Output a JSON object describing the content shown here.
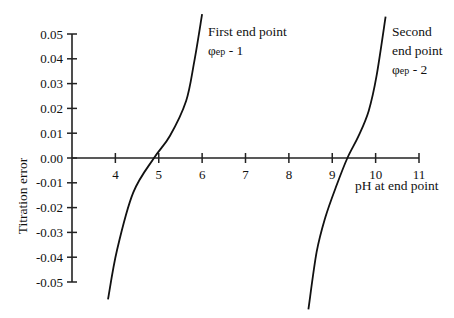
{
  "chart_data": {
    "type": "line",
    "title": "",
    "xlabel": "pH at end point",
    "ylabel": "Titration error",
    "xlim": [
      3,
      11
    ],
    "ylim": [
      -0.05,
      0.05
    ],
    "x_ticks": [
      4,
      5,
      6,
      7,
      8,
      9,
      10,
      11
    ],
    "x_tick_labels": [
      "4",
      "5",
      "6",
      "7",
      "8",
      "9",
      "10",
      "11"
    ],
    "y_ticks": [
      0.05,
      0.04,
      0.03,
      0.02,
      0.01,
      0.0,
      -0.01,
      -0.02,
      -0.03,
      -0.04,
      -0.05
    ],
    "y_tick_labels": [
      "0.05",
      "0.04",
      "0.03",
      "0.02",
      "0.01",
      "0.00",
      "-0.01",
      "-0.02",
      "-0.03",
      "-0.04",
      "-0.05"
    ],
    "grid": false,
    "legend": null,
    "series": [
      {
        "name": "First end point φep - 1",
        "x": [
          3.83,
          4.04,
          4.41,
          4.89,
          5.26,
          5.63,
          5.82,
          6.0
        ],
        "y": [
          -0.057,
          -0.037,
          -0.014,
          0.0,
          0.009,
          0.023,
          0.039,
          0.058
        ]
      },
      {
        "name": "Second end point φep - 2",
        "x": [
          8.45,
          8.64,
          8.84,
          9.1,
          9.35,
          9.61,
          9.84,
          10.02,
          10.23
        ],
        "y": [
          -0.061,
          -0.038,
          -0.024,
          -0.011,
          0.0,
          0.009,
          0.019,
          0.033,
          0.057
        ]
      }
    ],
    "annotations": [
      {
        "lines": [
          "First end point"
        ],
        "symbol": "φ",
        "sub": "ep",
        "suffix": " - 1",
        "near_series": 0
      },
      {
        "lines": [
          "Second",
          "end point"
        ],
        "symbol": "φ",
        "sub": "ep",
        "suffix": " - 2",
        "near_series": 1
      }
    ]
  },
  "labels": {
    "ylabel": "Titration error",
    "xlabel": "pH at end point",
    "anno1_line1": "First end point",
    "anno1_symbol": "φ",
    "anno1_sub": "ep",
    "anno1_suffix": " - 1",
    "anno2_line1": "Second",
    "anno2_line2": "end point",
    "anno2_symbol": "φ",
    "anno2_sub": "ep",
    "anno2_suffix": " - 2"
  },
  "style": {
    "line_color": "#111111",
    "axis_color": "#222222",
    "background": "#ffffff"
  }
}
